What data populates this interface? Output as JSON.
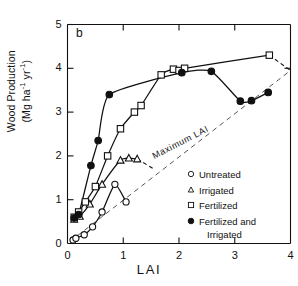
{
  "figure": {
    "panel_label": "b",
    "xlabel": "LAI",
    "ylabel_line1": "Wood Production",
    "ylabel_line2": "(Mg ha",
    "ylabel_sup1": "-1",
    "ylabel_mid": " yr",
    "ylabel_sup2": "-1",
    "ylabel_end": ")",
    "annotation": "Maximum LAI"
  },
  "axes": {
    "x_ticks": [
      "0",
      "1",
      "2",
      "3",
      "4"
    ],
    "y_ticks": [
      "0",
      "1",
      "2",
      "3",
      "4",
      "5"
    ]
  },
  "legend": {
    "items": [
      {
        "marker": "open-circle",
        "label": "Untreated",
        "label2": ""
      },
      {
        "marker": "open-triangle",
        "label": "Irrigated",
        "label2": ""
      },
      {
        "marker": "open-square",
        "label": "Fertilized",
        "label2": ""
      },
      {
        "marker": "filled-circle",
        "label": "Fertilized  and",
        "label2": "Irrigated"
      }
    ]
  },
  "chart_data": {
    "type": "scatter",
    "title": "b",
    "xlabel": "LAI",
    "ylabel": "Wood Production (Mg ha-1 yr-1)",
    "xlim": [
      0,
      4
    ],
    "ylim": [
      0,
      5
    ],
    "xticks": [
      0,
      1,
      2,
      3,
      4
    ],
    "yticks": [
      0,
      1,
      2,
      3,
      4,
      5
    ],
    "grid": false,
    "legend_position": "right-middle",
    "annotations": [
      {
        "text": "Maximum LAI",
        "x": 2.05,
        "y": 2.25,
        "rotation": -27
      }
    ],
    "reference_line": {
      "name": "Maximum LAI",
      "style": "dashed",
      "points": [
        [
          0.05,
          0.05
        ],
        [
          4.0,
          3.95
        ]
      ]
    },
    "series": [
      {
        "name": "Untreated",
        "marker": "open-circle",
        "x": [
          0.1,
          0.15,
          0.3,
          0.45,
          0.62,
          0.85,
          1.05
        ],
        "y": [
          0.08,
          0.12,
          0.2,
          0.38,
          0.72,
          1.35,
          0.95
        ]
      },
      {
        "name": "Irrigated",
        "marker": "open-triangle",
        "x": [
          0.12,
          0.22,
          0.4,
          0.62,
          0.95,
          1.1,
          1.25
        ],
        "y": [
          0.55,
          0.62,
          0.9,
          1.35,
          1.9,
          1.95,
          1.93
        ],
        "dashed_tail": [
          [
            1.25,
            1.93
          ],
          [
            1.55,
            1.7
          ]
        ]
      },
      {
        "name": "Fertilized",
        "marker": "open-square",
        "x": [
          0.12,
          0.2,
          0.32,
          0.5,
          0.72,
          0.95,
          1.2,
          1.32,
          1.68,
          1.9,
          2.0,
          2.1,
          3.62
        ],
        "y": [
          0.6,
          0.72,
          0.95,
          1.3,
          2.0,
          2.62,
          3.0,
          3.15,
          3.85,
          3.98,
          3.95,
          4.0,
          4.3
        ],
        "dashed_tail": [
          [
            3.62,
            4.3
          ],
          [
            4.0,
            3.95
          ]
        ]
      },
      {
        "name": "Fertilized and Irrigated",
        "marker": "filled-circle",
        "x": [
          0.12,
          0.2,
          0.42,
          0.55,
          0.75,
          2.05,
          2.58,
          3.1,
          3.3,
          3.6
        ],
        "y": [
          0.58,
          0.66,
          1.78,
          2.35,
          3.4,
          3.9,
          3.93,
          3.25,
          3.26,
          3.45
        ]
      }
    ]
  }
}
